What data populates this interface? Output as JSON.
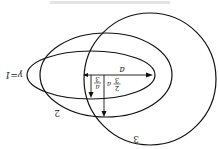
{
  "figure": {
    "orientation": "rotated 180 degrees",
    "curves": [
      {
        "label": "γ=1",
        "shape": "ellipse"
      },
      {
        "label": "2",
        "shape": "ellipse"
      },
      {
        "label": "3",
        "shape": "circle"
      }
    ],
    "arrows": [
      {
        "label": "a",
        "direction": "horizontal"
      },
      {
        "label_num": "a",
        "label_den": "3",
        "direction": "vertical"
      },
      {
        "label_prefix": "2",
        "label_den": "3",
        "label_suffix": "a",
        "direction": "vertical"
      }
    ]
  }
}
